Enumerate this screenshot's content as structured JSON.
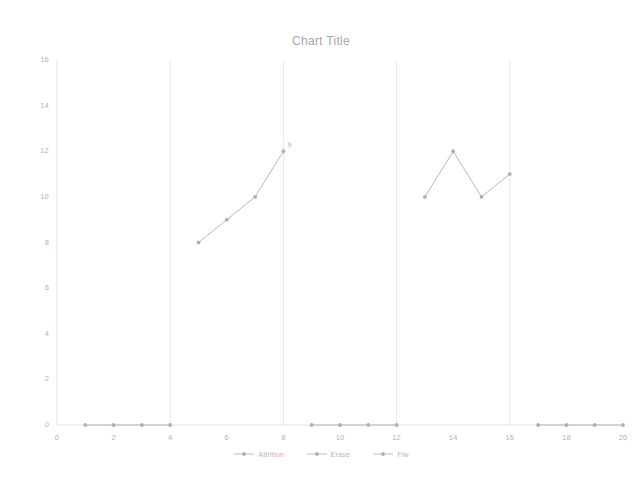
{
  "chart_data": {
    "type": "line",
    "title": "Chart Title",
    "xlabel": "",
    "ylabel": "",
    "xlim": [
      0,
      20
    ],
    "ylim": [
      0,
      16
    ],
    "xticks": [
      0,
      2,
      4,
      6,
      8,
      10,
      12,
      14,
      16,
      18,
      20
    ],
    "yticks": [
      0,
      2,
      4,
      6,
      8,
      10,
      12,
      14,
      16
    ],
    "grid": "vertical-major",
    "legend_position": "bottom",
    "series": [
      {
        "name": "Attrition",
        "color": "#b0b0b0",
        "x": [
          1,
          2,
          3,
          4
        ],
        "values": [
          0,
          0,
          0,
          0
        ]
      },
      {
        "name": "Erase",
        "color": "#b0b0b0",
        "x": [
          5,
          6,
          7,
          8
        ],
        "values": [
          8,
          9,
          10,
          12
        ]
      },
      {
        "name": "Flw",
        "color": "#b0b0b0",
        "x": [
          9,
          10,
          11,
          12
        ],
        "values": [
          0,
          0,
          0,
          0
        ]
      },
      {
        "name": "Attrition",
        "color": "#b0b0b0",
        "x": [
          13,
          14,
          15,
          16
        ],
        "values": [
          10,
          12,
          10,
          11
        ]
      },
      {
        "name": "Erase",
        "color": "#b0b0b0",
        "x": [
          17,
          18,
          19,
          20
        ],
        "values": [
          0,
          0,
          0,
          0
        ]
      }
    ],
    "annotations": [
      {
        "text": "9",
        "x": 8,
        "y": 12
      }
    ]
  },
  "chart": {
    "title": "Chart Title"
  },
  "axes": {
    "y_labels": [
      "16",
      "14",
      "12",
      "10",
      "8",
      "6",
      "4",
      "2",
      "0"
    ],
    "x_labels": [
      "0",
      "2",
      "4",
      "6",
      "8",
      "10",
      "12",
      "14",
      "16",
      "18",
      "20"
    ]
  },
  "legend": {
    "items": [
      {
        "label": "Attrition"
      },
      {
        "label": "Erase"
      },
      {
        "label": "Flw"
      }
    ]
  },
  "annotations": {
    "peak_label": "9"
  }
}
